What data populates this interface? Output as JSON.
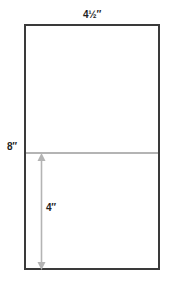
{
  "diagram": {
    "labels": {
      "top_width": "4½″",
      "left_height": "8″",
      "inner_height": "4″"
    },
    "shapes": {
      "rectangle": "outlined rectangle 4½ in wide by 8 in tall",
      "midline": "light gray horizontal line at half height",
      "arrow": "gray double-headed vertical arrow from midline to bottom edge, 4 in"
    },
    "colors": {
      "background": "#ffffff",
      "border": "#3a3a3a",
      "guide": "#b4b4b4",
      "text": "#1f1f1f"
    }
  }
}
